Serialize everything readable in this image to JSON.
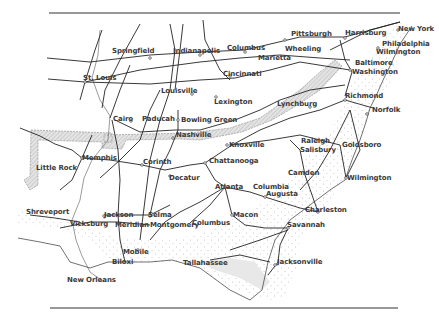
{
  "map": {
    "title": "",
    "colors": {
      "rail": "#222222",
      "coast_stipple": "#9a9a9a",
      "border_hatch": "#bfbfbf",
      "label": "#3a3a3a",
      "background": "#ffffff"
    },
    "cities": [
      {
        "name": "Springfield",
        "x": 112,
        "y": 51
      },
      {
        "name": "Indianapolis",
        "x": 173,
        "y": 51
      },
      {
        "name": "Columbus",
        "x": 227,
        "y": 48
      },
      {
        "name": "Pittsburgh",
        "x": 291,
        "y": 34
      },
      {
        "name": "Harrisburg",
        "x": 345,
        "y": 33
      },
      {
        "name": "New York",
        "x": 398,
        "y": 29
      },
      {
        "name": "Philadelphia",
        "x": 382,
        "y": 44
      },
      {
        "name": "Wilmington",
        "x": 376,
        "y": 52
      },
      {
        "name": "Wheeling",
        "x": 285,
        "y": 49
      },
      {
        "name": "Marietta",
        "x": 258,
        "y": 58
      },
      {
        "name": "Baltimore",
        "x": 355,
        "y": 63
      },
      {
        "name": "Washington",
        "x": 352,
        "y": 72
      },
      {
        "name": "St. Louis",
        "x": 83,
        "y": 78
      },
      {
        "name": "Cincinnati",
        "x": 223,
        "y": 74
      },
      {
        "name": "Louisville",
        "x": 161,
        "y": 91
      },
      {
        "name": "Lexington",
        "x": 214,
        "y": 102
      },
      {
        "name": "Lynchburg",
        "x": 277,
        "y": 104
      },
      {
        "name": "Richmond",
        "x": 345,
        "y": 96
      },
      {
        "name": "Norfolk",
        "x": 372,
        "y": 110
      },
      {
        "name": "Cairo",
        "x": 113,
        "y": 119
      },
      {
        "name": "Paducah",
        "x": 142,
        "y": 119
      },
      {
        "name": "Bowling Green",
        "x": 181,
        "y": 120
      },
      {
        "name": "Nashville",
        "x": 176,
        "y": 135
      },
      {
        "name": "Knoxville",
        "x": 229,
        "y": 145
      },
      {
        "name": "Raleigh",
        "x": 301,
        "y": 141
      },
      {
        "name": "Salisbury",
        "x": 300,
        "y": 150
      },
      {
        "name": "Goldsboro",
        "x": 342,
        "y": 145
      },
      {
        "name": "Little Rock",
        "x": 36,
        "y": 168
      },
      {
        "name": "Memphis",
        "x": 82,
        "y": 158
      },
      {
        "name": "Corinth",
        "x": 143,
        "y": 162
      },
      {
        "name": "Chattanooga",
        "x": 209,
        "y": 161
      },
      {
        "name": "Camden",
        "x": 288,
        "y": 173
      },
      {
        "name": "Decatur",
        "x": 169,
        "y": 178
      },
      {
        "name": "Atlanta",
        "x": 215,
        "y": 187
      },
      {
        "name": "Columbia",
        "x": 253,
        "y": 187
      },
      {
        "name": "Augusta",
        "x": 266,
        "y": 194
      },
      {
        "name": "Wilmington",
        "x": 347,
        "y": 178
      },
      {
        "name": "Charleston",
        "x": 305,
        "y": 210
      },
      {
        "name": "Shreveport",
        "x": 26,
        "y": 212
      },
      {
        "name": "Jackson",
        "x": 104,
        "y": 215
      },
      {
        "name": "Selma",
        "x": 148,
        "y": 215
      },
      {
        "name": "Macon",
        "x": 233,
        "y": 215
      },
      {
        "name": "Savannah",
        "x": 287,
        "y": 225
      },
      {
        "name": "Vicksburg",
        "x": 70,
        "y": 224
      },
      {
        "name": "Meridian",
        "x": 115,
        "y": 225
      },
      {
        "name": "Montgomery",
        "x": 150,
        "y": 225
      },
      {
        "name": "Columbus",
        "x": 192,
        "y": 223
      },
      {
        "name": "Mobile",
        "x": 123,
        "y": 252
      },
      {
        "name": "Biloxi",
        "x": 112,
        "y": 262
      },
      {
        "name": "Tallahassee",
        "x": 183,
        "y": 263
      },
      {
        "name": "Jacksonville",
        "x": 277,
        "y": 262
      },
      {
        "name": "New Orleans",
        "x": 67,
        "y": 280
      }
    ]
  }
}
